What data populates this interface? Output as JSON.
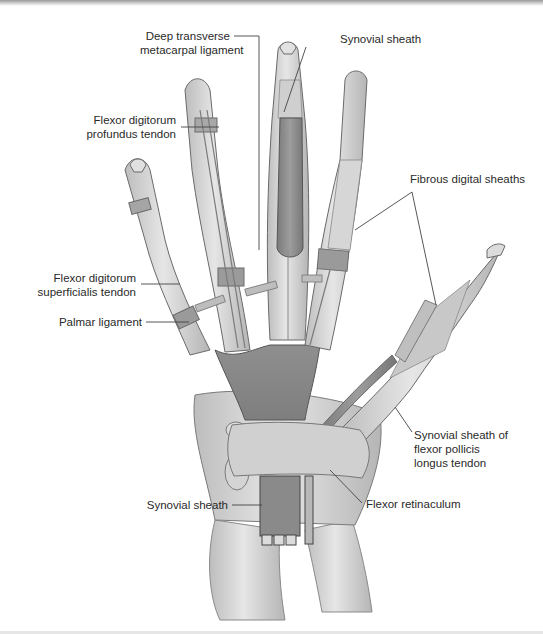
{
  "figure": {
    "colors": {
      "background": "#ffffff",
      "bone_skin": "#d9d9d9",
      "tendon_light": "#cfcfcf",
      "sheath_dark": "#8e8e8e",
      "outline": "#6a6a6a",
      "leader_line": "#444444",
      "label_text": "#2a2a2a"
    }
  },
  "labels": {
    "deep_transverse": "Deep transverse\nmetacarpal ligament",
    "synovial_sheath_top": "Synovial sheath",
    "fdp_tendon": "Flexor digitorum\nprofundus tendon",
    "fibrous_sheaths": "Fibrous digital sheaths",
    "fds_tendon": "Flexor digitorum\nsuperficialis tendon",
    "palmar_ligament": "Palmar ligament",
    "fpl_sheath": "Synovial sheath of\nflexor pollicis\nlongus tendon",
    "synovial_sheath_bottom": "Synovial sheath",
    "flexor_retinaculum": "Flexor retinaculum"
  }
}
